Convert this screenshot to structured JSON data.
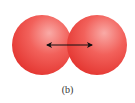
{
  "figure": {
    "caption": "(b)",
    "spheres": [
      {
        "name": "left-atom",
        "cx": 42,
        "cy": 45,
        "r": 30
      },
      {
        "name": "right-atom",
        "cx": 97,
        "cy": 45,
        "r": 30
      }
    ],
    "arrow": {
      "x1": 46,
      "y1": 45,
      "x2": 92,
      "y2": 45,
      "style": "double-headed"
    },
    "colors": {
      "sphere_highlight": "#f9a3a0",
      "sphere_mid": "#f0504a",
      "sphere_edge": "#e02a26",
      "arrow": "#111111",
      "caption": "#333333"
    }
  }
}
